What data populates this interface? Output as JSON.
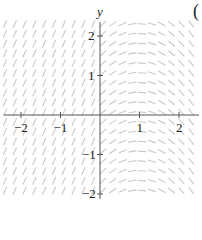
{
  "figure": {
    "type": "slope_field",
    "corner_label": "(",
    "axes": {
      "y_label": "y",
      "x_ticks": [
        {
          "value": -2,
          "label": "−2"
        },
        {
          "value": -1,
          "label": "−1"
        },
        {
          "value": 1,
          "label": "1"
        },
        {
          "value": 2,
          "label": "2"
        }
      ],
      "y_ticks": [
        {
          "value": 2,
          "label": "2"
        },
        {
          "value": 1,
          "label": "1"
        },
        {
          "value": -1,
          "label": "−1"
        },
        {
          "value": -2,
          "label": "−2"
        }
      ],
      "xlim": [
        -2.4,
        2.45
      ],
      "ylim": [
        -2.1,
        2.3
      ]
    },
    "field": {
      "description_left": "x < 0: uniform steep positive slopes",
      "description_right": "x >= 0: slope depends only on x, positive near 0, zero near x=1, negative beyond",
      "left_slope": 2.2,
      "right_slope_formula": "1 - x",
      "spacing": 0.25,
      "segment_color": "#c8c8c8",
      "axis_color": "#555555"
    }
  }
}
